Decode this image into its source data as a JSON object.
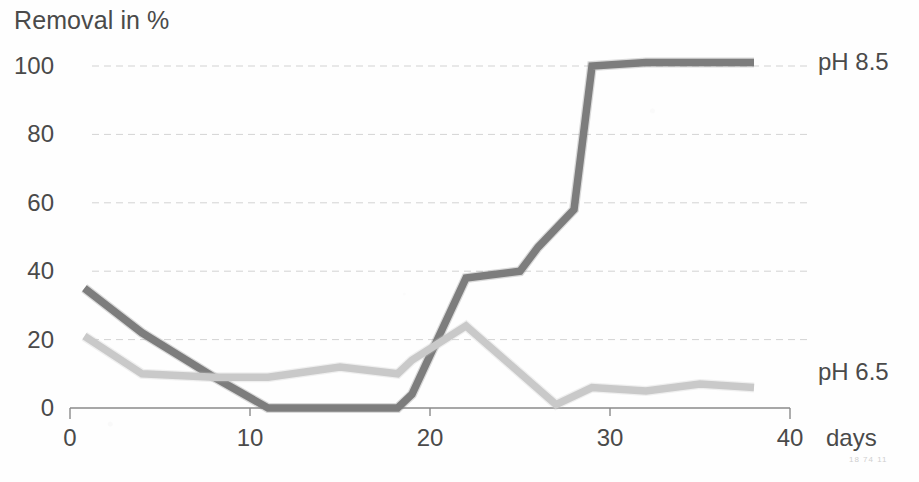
{
  "chart_data": {
    "type": "line",
    "title": "Removal in %",
    "xlabel": "days",
    "ylabel": "Removal in %",
    "xlim": [
      0,
      40
    ],
    "ylim": [
      0,
      100
    ],
    "grid": true,
    "legend_position": "right-inline-end-labels",
    "x_ticks": [
      "0",
      "10",
      "20",
      "30",
      "40"
    ],
    "x_tick_values": [
      0,
      10,
      20,
      30,
      40
    ],
    "y_ticks": [
      "0",
      "20",
      "40",
      "60",
      "80",
      "100"
    ],
    "y_tick_values": [
      0,
      20,
      40,
      60,
      80,
      100
    ],
    "series": [
      {
        "name": "pH 8.5",
        "color": "#7d7d7d",
        "x": [
          0.8,
          4,
          8,
          11,
          15,
          18.2,
          19,
          22,
          25,
          26,
          28,
          29,
          32,
          38
        ],
        "values": [
          35,
          22,
          9,
          0,
          0,
          0,
          4,
          38,
          40,
          47,
          58,
          100,
          101,
          101
        ]
      },
      {
        "name": "pH 6.5",
        "color": "#c9c9c9",
        "x": [
          0.8,
          4,
          8,
          11,
          15,
          18.2,
          19,
          22,
          27,
          29,
          32,
          35,
          38
        ],
        "values": [
          21,
          10,
          9,
          9,
          12,
          10,
          14,
          24,
          1,
          6,
          5,
          7,
          6
        ]
      }
    ]
  },
  "labels": {
    "axis_title": "Removal in %",
    "x_unit": "days",
    "series_ph85": "pH 8.5",
    "series_ph65": "pH 6.5",
    "scan_artifact": "18 74 11"
  }
}
